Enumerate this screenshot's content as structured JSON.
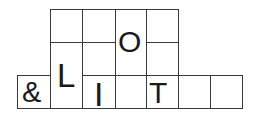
{
  "puzzle": {
    "line_color": "#3a3a3a",
    "text_color": "#1a1a1a",
    "cells": [
      {
        "id": "r1c1",
        "x": 50,
        "y": 9,
        "w": 33,
        "h": 34,
        "text": ""
      },
      {
        "id": "r1c2",
        "x": 82,
        "y": 9,
        "w": 34,
        "h": 34,
        "text": ""
      },
      {
        "id": "r1c4",
        "x": 146,
        "y": 9,
        "w": 33,
        "h": 34,
        "text": ""
      },
      {
        "id": "r2c2",
        "x": 82,
        "y": 42,
        "w": 34,
        "h": 34,
        "text": ""
      },
      {
        "id": "r2c4",
        "x": 146,
        "y": 42,
        "w": 33,
        "h": 34,
        "text": ""
      },
      {
        "id": "col1-rows2-3",
        "x": 50,
        "y": 42,
        "w": 33,
        "h": 67,
        "text": ""
      },
      {
        "id": "col3-rows1-2",
        "x": 115,
        "y": 9,
        "w": 32,
        "h": 67,
        "text": ""
      },
      {
        "id": "r3c0",
        "x": 17,
        "y": 75,
        "w": 34,
        "h": 34,
        "text": ""
      },
      {
        "id": "r3c2",
        "x": 82,
        "y": 75,
        "w": 34,
        "h": 34,
        "text": ""
      },
      {
        "id": "r3c3",
        "x": 115,
        "y": 75,
        "w": 32,
        "h": 34,
        "text": ""
      },
      {
        "id": "r3c4",
        "x": 146,
        "y": 75,
        "w": 33,
        "h": 34,
        "text": ""
      },
      {
        "id": "r3c5",
        "x": 178,
        "y": 75,
        "w": 33,
        "h": 34,
        "text": ""
      },
      {
        "id": "r3c6",
        "x": 210,
        "y": 75,
        "w": 33,
        "h": 34,
        "text": ""
      }
    ],
    "letters": [
      {
        "char": "&",
        "x": 22,
        "y": 78,
        "size": 29
      },
      {
        "char": "L",
        "x": 57,
        "y": 60,
        "size": 33
      },
      {
        "char": "I",
        "x": 93,
        "y": 77,
        "size": 34
      },
      {
        "char": "O",
        "x": 118,
        "y": 27,
        "size": 30
      },
      {
        "char": "T",
        "x": 149,
        "y": 78,
        "size": 30
      }
    ]
  }
}
